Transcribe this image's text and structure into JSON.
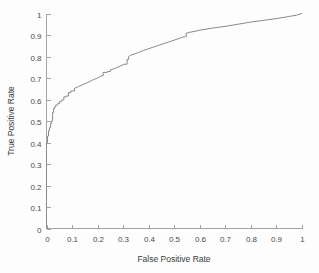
{
  "chart_data": {
    "type": "line",
    "title": "",
    "xlabel": "False Positive Rate",
    "ylabel": "True Positive Rate",
    "xlim": [
      0,
      1
    ],
    "ylim": [
      0,
      1
    ],
    "grid": false,
    "legend": null,
    "xticks": [
      0,
      0.1,
      0.2,
      0.3,
      0.4,
      0.5,
      0.6,
      0.7,
      0.8,
      0.9,
      1
    ],
    "yticks": [
      0,
      0.1,
      0.2,
      0.3,
      0.4,
      0.5,
      0.6,
      0.7,
      0.8,
      0.9,
      1
    ],
    "xticklabels": [
      "0",
      "0.1",
      "0.2",
      "0.3",
      "0.4",
      "0.5",
      "0.6",
      "0.7",
      "0.8",
      "0.9",
      "1"
    ],
    "yticklabels": [
      "0",
      "0.1",
      "0.2",
      "0.3",
      "0.4",
      "0.5",
      "0.6",
      "0.7",
      "0.8",
      "0.9",
      "1"
    ],
    "series": [
      {
        "name": "ROC curve",
        "color": "#8a8a8a",
        "x": [
          0.0,
          0.0,
          0.004,
          0.004,
          0.008,
          0.008,
          0.012,
          0.012,
          0.016,
          0.016,
          0.02,
          0.02,
          0.024,
          0.024,
          0.028,
          0.028,
          0.032,
          0.032,
          0.036,
          0.036,
          0.044,
          0.044,
          0.052,
          0.052,
          0.06,
          0.06,
          0.068,
          0.068,
          0.076,
          0.076,
          0.086,
          0.086,
          0.096,
          0.096,
          0.11,
          0.11,
          0.125,
          0.14,
          0.16,
          0.18,
          0.2,
          0.215,
          0.222,
          0.222,
          0.238,
          0.238,
          0.25,
          0.25,
          0.262,
          0.275,
          0.29,
          0.305,
          0.316,
          0.316,
          0.322,
          0.322,
          0.33,
          0.345,
          0.36,
          0.38,
          0.4,
          0.42,
          0.44,
          0.46,
          0.48,
          0.5,
          0.52,
          0.54,
          0.548,
          0.548,
          0.56,
          0.6,
          0.65,
          0.7,
          0.75,
          0.8,
          0.85,
          0.9,
          0.95,
          0.98,
          1.0
        ],
        "y": [
          0.0,
          0.4,
          0.4,
          0.43,
          0.43,
          0.455,
          0.455,
          0.47,
          0.47,
          0.49,
          0.49,
          0.5,
          0.5,
          0.54,
          0.54,
          0.558,
          0.558,
          0.566,
          0.566,
          0.574,
          0.574,
          0.582,
          0.582,
          0.592,
          0.592,
          0.598,
          0.598,
          0.612,
          0.612,
          0.616,
          0.616,
          0.632,
          0.632,
          0.64,
          0.64,
          0.652,
          0.66,
          0.668,
          0.678,
          0.69,
          0.7,
          0.71,
          0.71,
          0.726,
          0.726,
          0.73,
          0.73,
          0.738,
          0.742,
          0.748,
          0.756,
          0.764,
          0.764,
          0.786,
          0.786,
          0.8,
          0.806,
          0.812,
          0.818,
          0.828,
          0.836,
          0.844,
          0.852,
          0.86,
          0.868,
          0.876,
          0.884,
          0.892,
          0.892,
          0.908,
          0.912,
          0.922,
          0.932,
          0.94,
          0.95,
          0.96,
          0.968,
          0.976,
          0.986,
          0.992,
          1.0
        ]
      }
    ]
  },
  "axes": {
    "x_title": "False Positive Rate",
    "y_title": "True Positive Rate"
  }
}
